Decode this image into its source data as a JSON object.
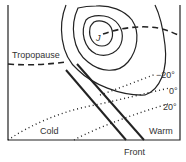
{
  "diagram": {
    "labels": {
      "tropopause": "Tropopause",
      "jet": "J",
      "iso_minus20": "−20°",
      "iso_0": "0°",
      "iso_20": "20°",
      "cold": "Cold",
      "warm": "Warm",
      "front": "Front"
    },
    "colors": {
      "line": "#222222",
      "text": "#333333",
      "background": "#ffffff"
    }
  }
}
